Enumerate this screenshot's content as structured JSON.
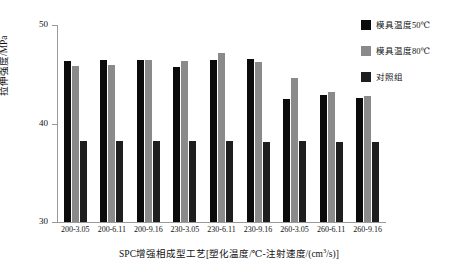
{
  "chart_data": {
    "type": "bar",
    "title": "",
    "xlabel": "SPC增强相成型工艺[塑化温度/℃-注射速度/(cm³/s)]",
    "ylabel": "拉伸强度/MPa",
    "ylim": [
      30,
      50
    ],
    "yticks": [
      30,
      40,
      50
    ],
    "ytick_labels": [
      "30",
      "40",
      "50"
    ],
    "grid": false,
    "legend_position": "top-right",
    "categories": [
      "200-3.05",
      "200-6.11",
      "200-9.16",
      "230-3.05",
      "230-6.11",
      "230-9.16",
      "260-3.05",
      "260-6.11",
      "260-9.16"
    ],
    "series": [
      {
        "name": "模具温度50℃",
        "color": "#0b0b0b",
        "values": [
          46.3,
          46.4,
          46.4,
          45.7,
          46.4,
          46.5,
          42.5,
          42.9,
          42.6
        ]
      },
      {
        "name": "模具温度80℃",
        "color": "#8a8a8a",
        "values": [
          45.8,
          45.9,
          46.4,
          46.3,
          47.2,
          46.2,
          44.6,
          43.2,
          42.8
        ]
      },
      {
        "name": "对照组",
        "color": "#1e1e1e",
        "values": [
          38.2,
          38.2,
          38.2,
          38.2,
          38.2,
          38.1,
          38.2,
          38.1,
          38.1
        ]
      }
    ]
  },
  "axis": {
    "y_label": "拉伸强度/MPa",
    "y_ticks": [
      "50",
      "40",
      "30"
    ],
    "x_title_main": "SPC增强相成型工艺[塑化温度/℃-注射速度/(cm",
    "x_title_sup": "3",
    "x_title_tail": "/s)]"
  },
  "legend": {
    "items": [
      {
        "label": "模具温度50℃",
        "series": "s0"
      },
      {
        "label": "模具温度80℃",
        "series": "s1"
      },
      {
        "label": "对照组",
        "series": "s2"
      }
    ]
  }
}
